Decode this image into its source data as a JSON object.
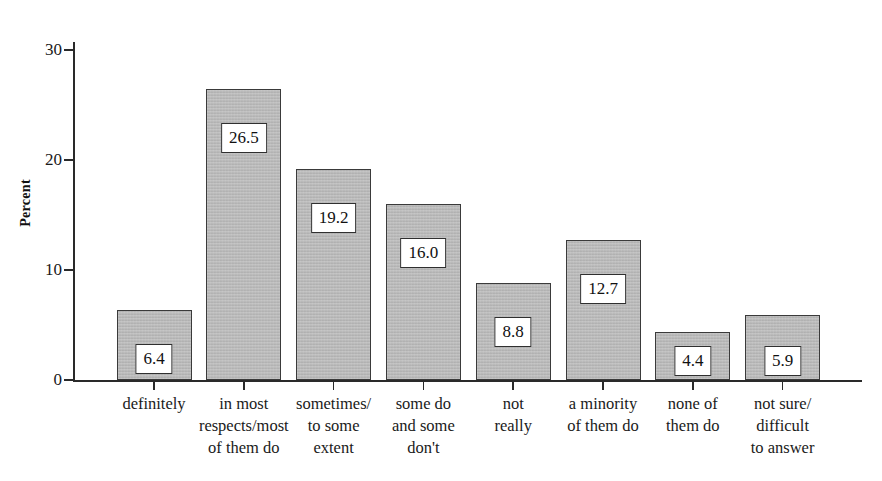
{
  "chart_data": {
    "type": "bar",
    "title": "",
    "xlabel": "",
    "ylabel": "Percent",
    "ylim": [
      0,
      32
    ],
    "yticks": [
      0,
      10,
      20,
      30
    ],
    "grid": false,
    "legend": null,
    "categories": [
      "definitely",
      "in most respects/most of them do",
      "sometimes/ to some extent",
      "some do and some don't",
      "not really",
      "a minority of them do",
      "none of them do",
      "not sure/ difficult to answer"
    ],
    "category_lines": [
      [
        "definitely"
      ],
      [
        "in most",
        "respects/most",
        "of them do"
      ],
      [
        "sometimes/",
        "to some",
        "extent"
      ],
      [
        "some do",
        "and some",
        "don't"
      ],
      [
        "not",
        "really"
      ],
      [
        "a minority",
        "of them do"
      ],
      [
        "none of",
        "them do"
      ],
      [
        "not sure/",
        "difficult",
        "to answer"
      ]
    ],
    "values": [
      6.4,
      26.5,
      19.2,
      16.0,
      8.8,
      12.7,
      4.4,
      5.9
    ],
    "value_labels": [
      "6.4",
      "26.5",
      "19.2",
      "16.0",
      "8.8",
      "12.7",
      "4.4",
      "5.9"
    ],
    "bar_fill_color": "#b6b6b6",
    "bar_border_color": "#3a3a3a",
    "value_box_fill": "#ffffff",
    "value_box_border": "#2f2f2f",
    "axis_color": "#2a2a2a",
    "background_color": "#ffffff"
  },
  "axis": {
    "y_title": "Percent",
    "y_tick_labels": [
      "0",
      "10",
      "20",
      "30"
    ]
  }
}
